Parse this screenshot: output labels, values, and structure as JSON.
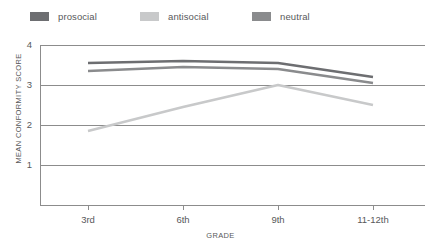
{
  "legend": {
    "position": "top-left",
    "items": [
      {
        "label": "prosocial",
        "color": "#6d6e71"
      },
      {
        "label": "antisocial",
        "color": "#c8c9ca"
      },
      {
        "label": "neutral",
        "color": "#8a8b8d"
      }
    ]
  },
  "axes": {
    "ylabel": "MEAN CONFORMITY SCORE",
    "xlabel": "GRADE",
    "yticks": [
      "1",
      "2",
      "3",
      "4"
    ],
    "xticks": [
      "3rd",
      "6th",
      "9th",
      "11-12th"
    ]
  },
  "chart_data": {
    "type": "line",
    "title": "",
    "xlabel": "GRADE",
    "ylabel": "MEAN CONFORMITY SCORE",
    "categories": [
      "3rd",
      "6th",
      "9th",
      "11-12th"
    ],
    "ylim": [
      0,
      4
    ],
    "yticks": [
      1,
      2,
      3,
      4
    ],
    "grid": true,
    "legend_position": "top-left",
    "series": [
      {
        "name": "prosocial",
        "color": "#6d6e71",
        "values": [
          3.55,
          3.6,
          3.55,
          3.2
        ]
      },
      {
        "name": "antisocial",
        "color": "#c8c9ca",
        "values": [
          1.85,
          2.45,
          3.0,
          2.5
        ]
      },
      {
        "name": "neutral",
        "color": "#8a8b8d",
        "values": [
          3.35,
          3.45,
          3.4,
          3.05
        ]
      }
    ]
  },
  "colors": {
    "grid": "#8c8c8c",
    "axis": "#8c8c8c",
    "text": "#58595b"
  }
}
